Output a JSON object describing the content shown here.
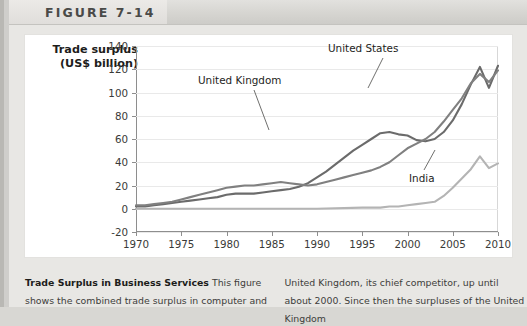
{
  "header": {
    "figure_label": "FIGURE 7-14"
  },
  "chart_data": {
    "type": "line",
    "title": "",
    "xlabel": "",
    "ylabel": "Trade surplus (US$ billion)",
    "ylabel_line1": "Trade surplus",
    "ylabel_line2": "(US$ billion)",
    "xlim": [
      1970,
      2010
    ],
    "ylim": [
      -20,
      140
    ],
    "yticks": [
      140,
      120,
      100,
      80,
      60,
      40,
      20,
      0,
      -20
    ],
    "xticks": [
      1970,
      1975,
      1980,
      1985,
      1990,
      1995,
      2000,
      2005,
      2010
    ],
    "grid": true,
    "legend_position": "inline-annotations",
    "colors": {
      "united_states": "#6b6b6b",
      "united_kingdom": "#808080",
      "india": "#b4b4b4"
    },
    "series": [
      {
        "name": "United States",
        "color": "#6b6b6b",
        "x": [
          1970,
          1971,
          1972,
          1973,
          1974,
          1975,
          1976,
          1977,
          1978,
          1979,
          1980,
          1981,
          1982,
          1983,
          1984,
          1985,
          1986,
          1987,
          1988,
          1989,
          1990,
          1991,
          1992,
          1993,
          1994,
          1995,
          1996,
          1997,
          1998,
          1999,
          2000,
          2001,
          2002,
          2003,
          2004,
          2005,
          2006,
          2007,
          2008,
          2009,
          2010
        ],
        "values": [
          2,
          2,
          3,
          4,
          5,
          6,
          7,
          8,
          9,
          10,
          12,
          13,
          13,
          13,
          14,
          15,
          16,
          17,
          19,
          22,
          27,
          32,
          38,
          44,
          50,
          55,
          60,
          65,
          66,
          64,
          63,
          59,
          58,
          60,
          66,
          76,
          90,
          107,
          122,
          104,
          123
        ]
      },
      {
        "name": "United Kingdom",
        "color": "#808080",
        "x": [
          1970,
          1971,
          1972,
          1973,
          1974,
          1975,
          1976,
          1977,
          1978,
          1979,
          1980,
          1981,
          1982,
          1983,
          1984,
          1985,
          1986,
          1987,
          1988,
          1989,
          1990,
          1991,
          1992,
          1993,
          1994,
          1995,
          1996,
          1997,
          1998,
          1999,
          2000,
          2001,
          2002,
          2003,
          2004,
          2005,
          2006,
          2007,
          2008,
          2009,
          2010
        ],
        "values": [
          3,
          3,
          4,
          5,
          6,
          8,
          10,
          12,
          14,
          16,
          18,
          19,
          20,
          20,
          21,
          22,
          23,
          22,
          21,
          20,
          21,
          23,
          25,
          27,
          29,
          31,
          33,
          36,
          40,
          46,
          52,
          56,
          60,
          66,
          75,
          85,
          95,
          108,
          116,
          109,
          119
        ]
      },
      {
        "name": "India",
        "color": "#b4b4b4",
        "x": [
          1970,
          1975,
          1980,
          1985,
          1990,
          1995,
          1996,
          1997,
          1998,
          1999,
          2000,
          2001,
          2002,
          2003,
          2004,
          2005,
          2006,
          2007,
          2008,
          2009,
          2010
        ],
        "values": [
          0,
          0,
          0,
          0,
          0,
          1,
          1,
          1,
          2,
          2,
          3,
          4,
          5,
          6,
          11,
          18,
          26,
          34,
          45,
          35,
          39
        ]
      }
    ],
    "annotations": [
      {
        "text": "United States",
        "points_to_series": "United States"
      },
      {
        "text": "United Kingdom",
        "points_to_series": "United Kingdom"
      },
      {
        "text": "India",
        "points_to_series": "India"
      }
    ]
  },
  "caption": {
    "title": "Trade Surplus in Business Services",
    "left_text": " This figure shows the combined trade surplus in computer and",
    "right_text": "United Kingdom, its chief competitor, up until about 2000. Since then the surpluses of the United Kingdom"
  }
}
